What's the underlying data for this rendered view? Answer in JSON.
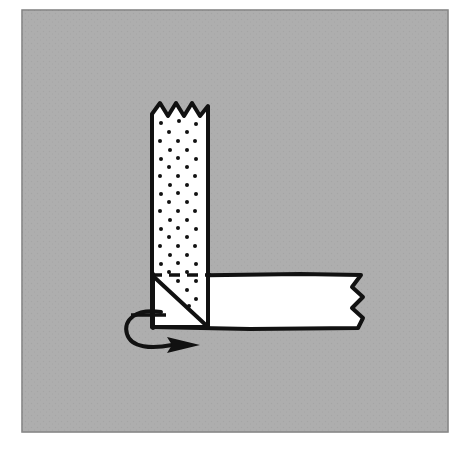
{
  "figure": {
    "title": "Paper strip fold step diagram",
    "caption": "Dotted vertical strip folded diagonally to form a horizontal white strip, with a curved fold-over arrow",
    "type": "origami-instruction-diagram",
    "colors": {
      "page_background": "#ffffff",
      "panel_background": "#a8a8a8",
      "panel_border": "#7d7d7d",
      "ink": "#111111",
      "paper_fill": "#ffffff",
      "dot_color": "#111111"
    }
  },
  "panel": {
    "name": "illustration-panel",
    "x": 22,
    "y": 10,
    "width": 426,
    "height": 422
  },
  "vertical_strip": {
    "name": "vertical-dotted-strip",
    "label": "Patterned (dotted) paper strip running vertically",
    "left": 152,
    "right": 208,
    "top": 103,
    "bottom": 327,
    "fill": "#ffffff",
    "pattern": "dots",
    "torn_edge": "top",
    "torn_edge_peaks": 4
  },
  "horizontal_strip": {
    "name": "horizontal-white-strip",
    "label": "Plain white paper strip running horizontally to the right",
    "left": 152,
    "right": 362,
    "top": 275,
    "bottom": 327,
    "fill": "#ffffff",
    "torn_edge": "right",
    "torn_edge_peaks": 3
  },
  "fold": {
    "name": "diagonal-fold",
    "crease_line": {
      "name": "dashed-crease-line",
      "style": "dashed",
      "from_x": 152,
      "from_y": 275,
      "to_x": 208,
      "to_y": 275
    },
    "diagonal_line": {
      "name": "diagonal-fold-edge",
      "style": "solid",
      "from_x": 152,
      "from_y": 275,
      "to_x": 208,
      "to_y": 327
    },
    "tick_mark": {
      "name": "edge-tick-mark",
      "from_x": 131,
      "from_y": 315,
      "to_x": 165,
      "to_y": 315
    }
  },
  "arrow": {
    "name": "fold-over-arrow",
    "label": "Curved arrow indicating the strip folds over and to the right",
    "direction": "right",
    "style": "curved-solid",
    "start_x": 160,
    "start_y": 313,
    "tip_x": 197,
    "tip_y": 344
  },
  "dots": {
    "name": "dot-pattern",
    "radius": 2.0,
    "columns": 3,
    "row_spacing": 17,
    "stagger": true,
    "points": [
      [
        161,
        123
      ],
      [
        179,
        121
      ],
      [
        196,
        124
      ],
      [
        169,
        132
      ],
      [
        187,
        132
      ],
      [
        160,
        141
      ],
      [
        178,
        141
      ],
      [
        195,
        141
      ],
      [
        170,
        150
      ],
      [
        187,
        150
      ],
      [
        161,
        159
      ],
      [
        178,
        158
      ],
      [
        196,
        159
      ],
      [
        169,
        167
      ],
      [
        187,
        167
      ],
      [
        160,
        176
      ],
      [
        178,
        176
      ],
      [
        195,
        176
      ],
      [
        170,
        185
      ],
      [
        187,
        185
      ],
      [
        161,
        194
      ],
      [
        178,
        193
      ],
      [
        196,
        194
      ],
      [
        169,
        202
      ],
      [
        187,
        202
      ],
      [
        160,
        211
      ],
      [
        178,
        211
      ],
      [
        195,
        211
      ],
      [
        170,
        220
      ],
      [
        187,
        220
      ],
      [
        161,
        229
      ],
      [
        178,
        228
      ],
      [
        196,
        229
      ],
      [
        169,
        237
      ],
      [
        187,
        237
      ],
      [
        160,
        246
      ],
      [
        178,
        246
      ],
      [
        195,
        246
      ],
      [
        170,
        255
      ],
      [
        187,
        255
      ],
      [
        161,
        264
      ],
      [
        178,
        263
      ],
      [
        196,
        264
      ],
      [
        169,
        272
      ],
      [
        187,
        272
      ],
      [
        178,
        281
      ],
      [
        196,
        281
      ],
      [
        187,
        290
      ],
      [
        196,
        299
      ],
      [
        189,
        306
      ]
    ]
  }
}
